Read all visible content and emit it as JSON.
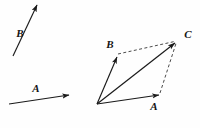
{
  "figure": {
    "background_color": "#fefefe",
    "stroke_color": "#1a1a1a",
    "label_color": "#141414",
    "width": 200,
    "height": 128
  },
  "given_vectors": {
    "caption": "Given vectors drawn separately at left",
    "items": [
      {
        "name": "vector-b-given",
        "label": "B",
        "label_x": 20,
        "label_y": 34,
        "tail_x": 13,
        "tail_y": 56,
        "tip_x": 37,
        "tip_y": 5,
        "style": "solid",
        "arrowhead": "filled"
      },
      {
        "name": "vector-a-given",
        "label": "A",
        "label_x": 36,
        "label_y": 89,
        "tail_x": 9,
        "tail_y": 104,
        "tip_x": 69,
        "tip_y": 95,
        "style": "solid",
        "arrowhead": "filled"
      }
    ]
  },
  "parallelogram": {
    "caption": "Parallelogram construction with resultant C",
    "origin": {
      "name": "origin-vertex",
      "x": 97,
      "y": 104
    },
    "vertices": [
      {
        "name": "vertex-origin",
        "label": "",
        "x": 97,
        "y": 104
      },
      {
        "name": "vertex-b",
        "label": "B",
        "x": 117,
        "y": 56,
        "label_x": 110,
        "label_y": 45
      },
      {
        "name": "vertex-c",
        "label": "C",
        "x": 176,
        "y": 42,
        "label_x": 188,
        "label_y": 35
      },
      {
        "name": "vertex-a",
        "label": "A",
        "x": 159,
        "y": 95,
        "label_x": 154,
        "label_y": 107
      }
    ],
    "solid_edges": [
      {
        "name": "edge-origin-to-b",
        "from": "origin",
        "to": "B",
        "x1": 97,
        "y1": 104,
        "x2": 117,
        "y2": 56,
        "arrowhead": "filled"
      },
      {
        "name": "edge-origin-to-a",
        "from": "origin",
        "to": "A",
        "x1": 97,
        "y1": 104,
        "x2": 159,
        "y2": 95,
        "arrowhead": "filled"
      },
      {
        "name": "edge-origin-to-c-resultant",
        "from": "origin",
        "to": "C",
        "x1": 97,
        "y1": 104,
        "x2": 176,
        "y2": 42,
        "arrowhead": "filled"
      }
    ],
    "dashed_edges": [
      {
        "name": "dashed-b-to-c",
        "from": "B",
        "to": "C",
        "x1": 118,
        "y1": 54,
        "x2": 175,
        "y2": 41
      },
      {
        "name": "dashed-a-to-c",
        "from": "A",
        "to": "C",
        "x1": 160,
        "y1": 93,
        "x2": 176,
        "y2": 43
      }
    ]
  },
  "labels": {
    "b_given": "B",
    "a_given": "A",
    "b_parallelogram": "B",
    "a_parallelogram": "A",
    "c_resultant": "C"
  }
}
